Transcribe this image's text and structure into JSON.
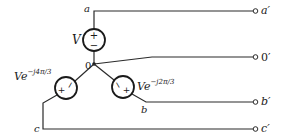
{
  "diagram": {
    "nodes": {
      "a": "a",
      "b": "b",
      "c": "c",
      "neutral": "0"
    },
    "terminals": {
      "a_prime": "a′",
      "neutral_prime": "0′",
      "b_prime": "b′",
      "c_prime": "c′"
    },
    "sources": {
      "phase_a": {
        "label": "V",
        "plus": "+",
        "minus": "−"
      },
      "phase_b": {
        "label_base": "Ve",
        "label_exp": "−j2π/3",
        "plus": "+",
        "minus": "−"
      },
      "phase_c": {
        "label_base": "Ve",
        "label_exp": "−j4π/3",
        "plus": "+",
        "minus": "−"
      }
    },
    "colors": {
      "line": "#2a2a2a",
      "background": "#ffffff"
    }
  }
}
